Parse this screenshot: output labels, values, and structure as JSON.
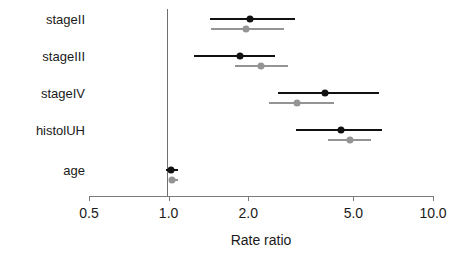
{
  "chart_data": {
    "type": "scatter",
    "subtype": "forest-plot",
    "title": "",
    "xlabel": "Rate ratio",
    "ylabel": "",
    "xscale": "log",
    "xlim": [
      0.5,
      10.0
    ],
    "xticks": [
      0.5,
      1.0,
      2.0,
      5.0,
      10.0
    ],
    "xtick_labels": [
      "0.5",
      "1.0",
      "2.0",
      "5.0",
      "10.0"
    ],
    "grid": false,
    "legend": "none",
    "reference_line": 1.0,
    "categories": [
      "stageII",
      "stageIII",
      "stageIV",
      "histolUH",
      "age"
    ],
    "series": [
      {
        "name": "black",
        "color": "#111111",
        "estimates": [
          2.03,
          1.86,
          3.91,
          4.47,
          1.02
        ],
        "ci_low": [
          1.43,
          1.25,
          2.6,
          3.03,
          0.98
        ],
        "ci_high": [
          3.01,
          2.52,
          6.24,
          6.43,
          1.09
        ]
      },
      {
        "name": "gray",
        "color": "#949494",
        "estimates": [
          1.96,
          2.23,
          3.07,
          4.86,
          1.03
        ],
        "ci_low": [
          1.45,
          1.78,
          2.39,
          4.0,
          1.0
        ],
        "ci_high": [
          2.74,
          2.83,
          4.22,
          5.83,
          1.09
        ]
      }
    ]
  },
  "geometry": {
    "plot_left": 89,
    "plot_right": 433,
    "axis_y": 196,
    "tick_length": 5,
    "row_y": [
      19,
      56,
      93,
      130,
      170
    ],
    "series_offset": [
      0,
      10
    ],
    "label_right": 85,
    "xlabel_y": 232,
    "refline_top": 9,
    "refline_bottom": 196
  }
}
